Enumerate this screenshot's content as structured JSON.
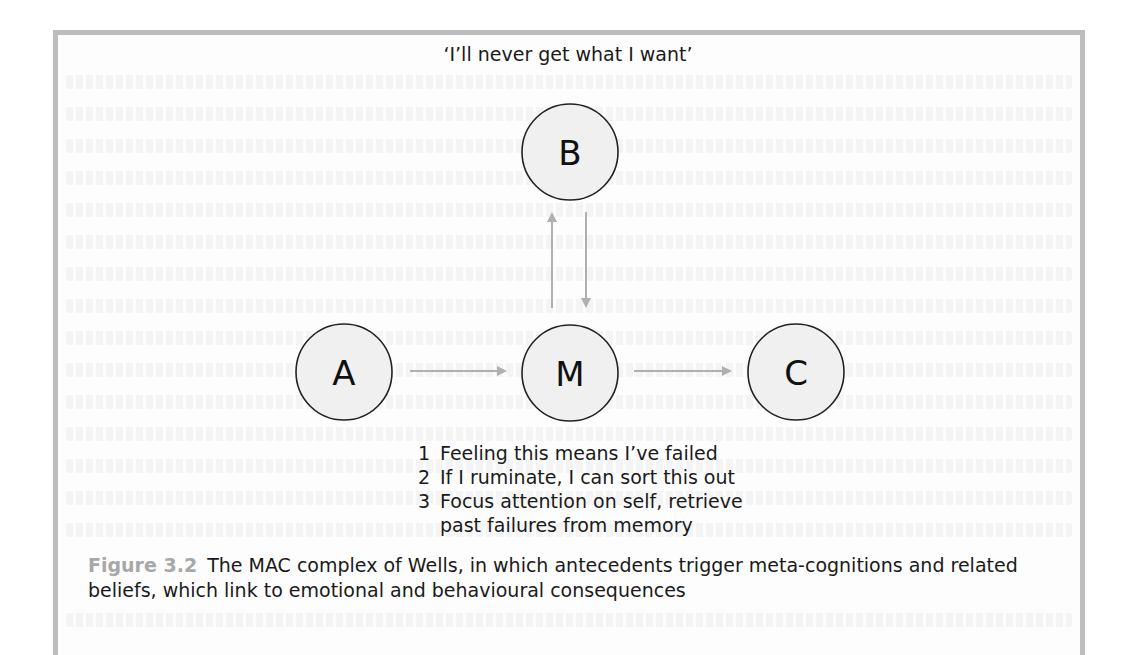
{
  "figure": {
    "number": "Figure 3.2",
    "caption": "The MAC complex of Wells, in which antecedents trigger meta-cognitions and related beliefs, which link to emotional and behavioural consequences"
  },
  "nodes": {
    "A": {
      "label": "A",
      "cx": 344,
      "cy": 372,
      "r": 48
    },
    "B": {
      "label": "B",
      "cx": 570,
      "cy": 152,
      "r": 48,
      "annotation": "‘I’ll never get what I want’"
    },
    "M": {
      "label": "M",
      "cx": 570,
      "cy": 373,
      "r": 48
    },
    "C": {
      "label": "C",
      "cx": 796,
      "cy": 372,
      "r": 48
    }
  },
  "edges": [
    {
      "from": "A",
      "to": "M",
      "direction": "right"
    },
    {
      "from": "M",
      "to": "C",
      "direction": "right"
    },
    {
      "from": "M",
      "to": "B",
      "direction": "up"
    },
    {
      "from": "B",
      "to": "M",
      "direction": "down"
    }
  ],
  "m_beliefs": [
    {
      "num": "1",
      "text": "Feeling this means I’ve failed"
    },
    {
      "num": "2",
      "text": "If I ruminate, I can sort this out"
    },
    {
      "num": "3",
      "text": "Focus attention on self, retrieve past failures from memory"
    }
  ],
  "colors": {
    "frame": "#bdbdbd",
    "arrow": "#b0b0b0",
    "node_fill": "#f0f0f0",
    "node_stroke": "#222222",
    "figure_number": "#a8a8a8",
    "text": "#1a1a1a"
  }
}
